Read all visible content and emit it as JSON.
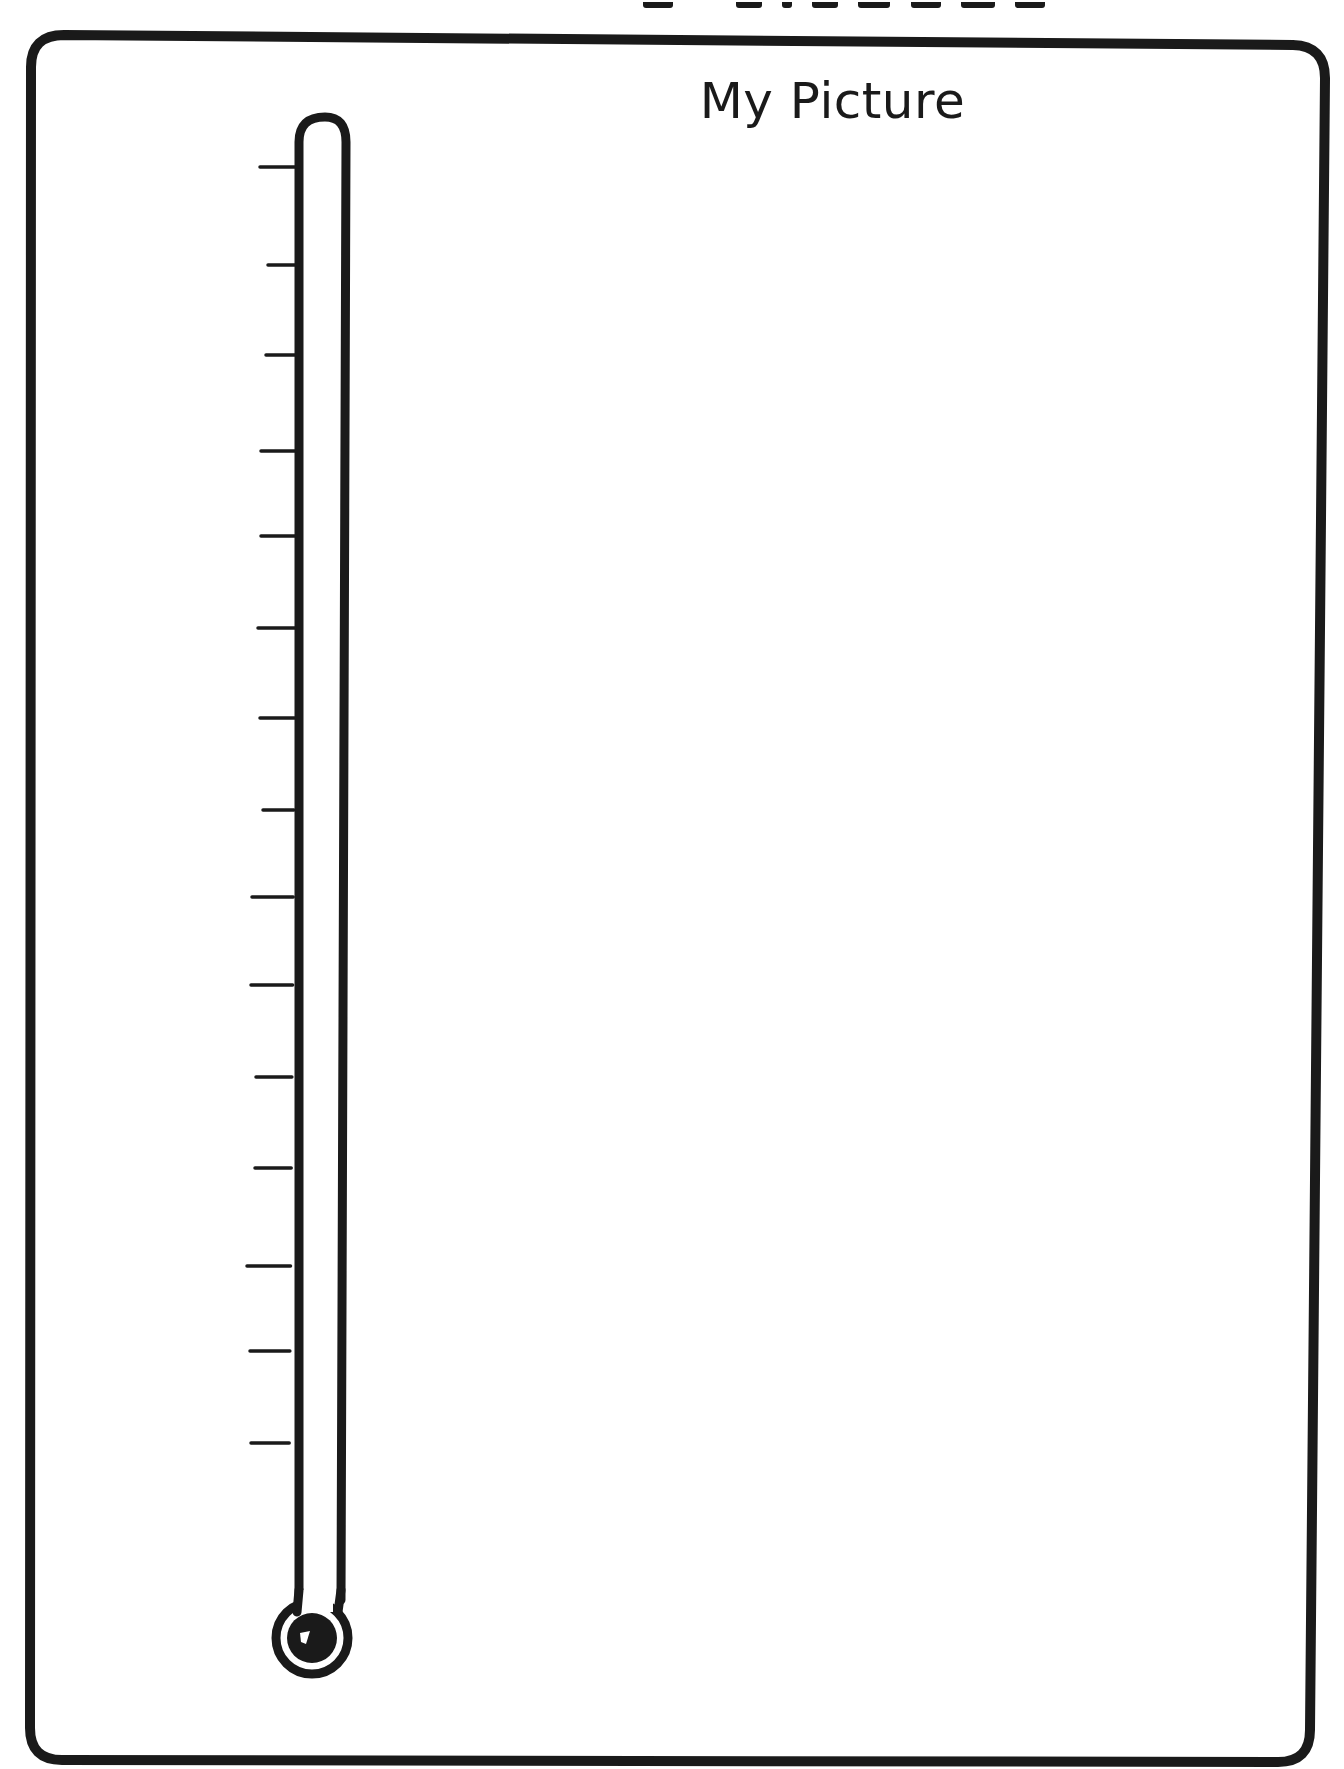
{
  "page": {
    "width": 1344,
    "height": 1769,
    "background": "#ffffff",
    "ink_color": "#1a1a1a"
  },
  "top_title": {
    "cut_off": true,
    "visible_glyph_fragments": 7
  },
  "frame": {
    "label": "My Picture",
    "border_color": "#1a1a1a",
    "border_width": 10,
    "corner_radius": 32,
    "drawing_area": {
      "content": ""
    }
  },
  "thermometer": {
    "icon": "thermometer-icon",
    "tube": {
      "top_y": 117,
      "bottom_y": 1600,
      "left_x_top": 303,
      "left_x_bottom": 292,
      "inner_width": 32,
      "wall_width": 9
    },
    "bulb": {
      "cx": 312,
      "cy": 1638,
      "outer_radius": 40,
      "inner_radius": 26
    },
    "tick_count": 15,
    "ticks": [
      {
        "y": 167,
        "x1": 260
      },
      {
        "y": 265,
        "x1": 268
      },
      {
        "y": 355,
        "x1": 266
      },
      {
        "y": 451,
        "x1": 261
      },
      {
        "y": 536,
        "x1": 261
      },
      {
        "y": 628,
        "x1": 258
      },
      {
        "y": 718,
        "x1": 260
      },
      {
        "y": 810,
        "x1": 263
      },
      {
        "y": 897,
        "x1": 252
      },
      {
        "y": 985,
        "x1": 251
      },
      {
        "y": 1077,
        "x1": 256
      },
      {
        "y": 1168,
        "x1": 255
      },
      {
        "y": 1266,
        "x1": 247
      },
      {
        "y": 1351,
        "x1": 250
      },
      {
        "y": 1443,
        "x1": 251
      }
    ],
    "fill_level": 0
  }
}
